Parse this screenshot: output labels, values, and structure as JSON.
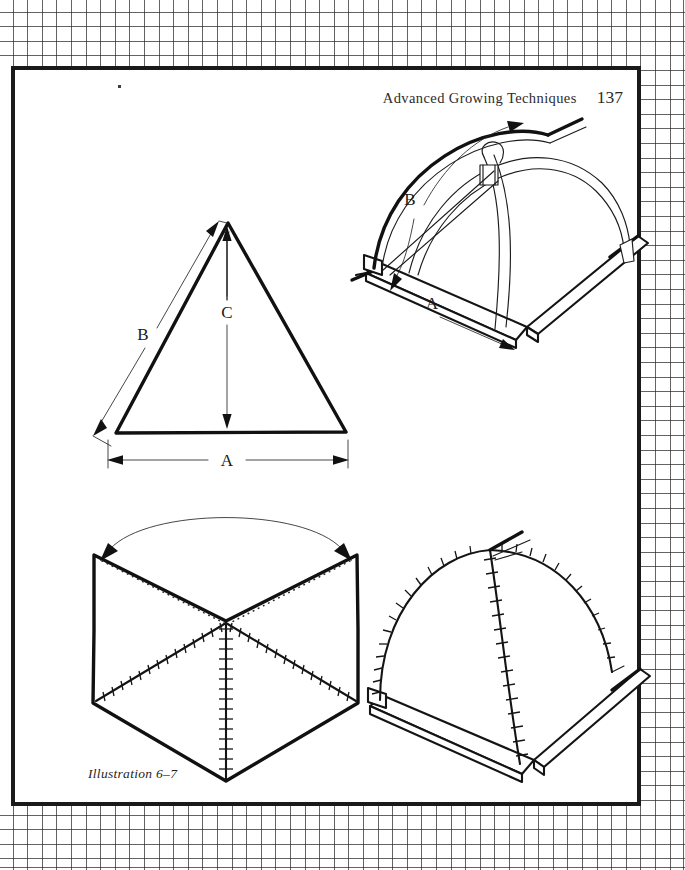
{
  "page": {
    "kind": "book-page-scan",
    "background": "graph-paper",
    "paper_color": "#ffffff",
    "ink_color": "#111111",
    "width": 685,
    "height": 870
  },
  "running_head": {
    "title": "Advanced Growing Techniques",
    "folio": "137"
  },
  "caption": {
    "text": "Illustration 6–7"
  },
  "figures": [
    {
      "id": "triangle-diagram",
      "name": "triangle-dimensions",
      "position": "upper-left",
      "description": "Isosceles triangle with dimension callouts",
      "labels": [
        {
          "key": "A",
          "text": "A",
          "meaning": "base-width"
        },
        {
          "key": "B",
          "text": "B",
          "meaning": "slant-side-length"
        },
        {
          "key": "C",
          "text": "C",
          "meaning": "vertical-height"
        }
      ]
    },
    {
      "id": "hoop-frame-diagram",
      "name": "hoop-frame-assembly",
      "position": "upper-right",
      "description": "Perspective view of square base frame with two crossing bent hoops joined by a clamp at the apex",
      "labels": [
        {
          "key": "A",
          "text": "A",
          "meaning": "base-rail-length"
        },
        {
          "key": "B",
          "text": "B",
          "meaning": "hoop-arc-length"
        }
      ]
    },
    {
      "id": "fabric-pattern-diagram",
      "name": "fabric-cover-pattern",
      "position": "lower-left",
      "description": "Flat fabric cover pattern with three stitched seams radiating from center and curved fold arrow across the top corners",
      "labels": []
    },
    {
      "id": "finished-cover-diagram",
      "name": "finished-dome-cover",
      "position": "lower-right",
      "description": "Finished stitched dome cover fitted over the base frame",
      "labels": []
    }
  ]
}
